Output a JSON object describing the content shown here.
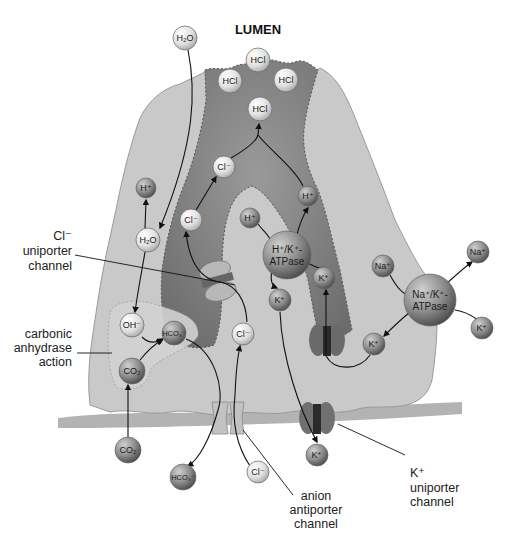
{
  "title": "LUMEN",
  "labels": {
    "cl_uniporter": [
      "Cl⁻",
      "uniporter",
      "channel"
    ],
    "carbonic": [
      "carbonic",
      "anhydrase",
      "action"
    ],
    "anion_antiporter": [
      "anion",
      "antiporter",
      "channel"
    ],
    "k_uniporter": [
      "K⁺",
      "uniporter",
      "channel"
    ]
  },
  "molecules": [
    {
      "id": "h2o-lumen",
      "text": "H₂O",
      "x": 185,
      "y": 38,
      "r": 12,
      "shade": "light"
    },
    {
      "id": "hcl-top",
      "text": "HCl",
      "x": 258,
      "y": 60,
      "r": 12,
      "shade": "light"
    },
    {
      "id": "hcl-left",
      "text": "HCl",
      "x": 230,
      "y": 81,
      "r": 12,
      "shade": "light"
    },
    {
      "id": "hcl-right",
      "text": "HCl",
      "x": 286,
      "y": 80,
      "r": 12,
      "shade": "light"
    },
    {
      "id": "hcl-center",
      "text": "HCl",
      "x": 260,
      "y": 109,
      "r": 12,
      "shade": "light"
    },
    {
      "id": "cl-upper",
      "text": "Cl⁻",
      "x": 224,
      "y": 167,
      "r": 11,
      "shade": "light"
    },
    {
      "id": "cl-mid",
      "text": "Cl⁻",
      "x": 191,
      "y": 220,
      "r": 11,
      "shade": "light"
    },
    {
      "id": "h-left",
      "text": "H⁺",
      "x": 146,
      "y": 188,
      "r": 10,
      "shade": "dark"
    },
    {
      "id": "h2o-cell",
      "text": "H₂O",
      "x": 148,
      "y": 240,
      "r": 12,
      "shade": "light"
    },
    {
      "id": "h-right-upper",
      "text": "H⁺",
      "x": 308,
      "y": 196,
      "r": 10,
      "shade": "dark"
    },
    {
      "id": "h-right-lower",
      "text": "H⁺",
      "x": 250,
      "y": 218,
      "r": 10,
      "shade": "dark"
    },
    {
      "id": "hk-atpase",
      "text": "H⁺/K⁺-|ATPase",
      "x": 287,
      "y": 255,
      "r": 24,
      "shade": "dark"
    },
    {
      "id": "k-channel-top",
      "text": "K⁺",
      "x": 324,
      "y": 278,
      "r": 11,
      "shade": "dark"
    },
    {
      "id": "k-left",
      "text": "K⁺",
      "x": 280,
      "y": 300,
      "r": 11,
      "shade": "dark"
    },
    {
      "id": "oh",
      "text": "OH⁻",
      "x": 132,
      "y": 325,
      "r": 12,
      "shade": "light"
    },
    {
      "id": "hco3-cell",
      "text": "HCO₃⁻",
      "x": 174,
      "y": 333,
      "r": 12,
      "shade": "dark"
    },
    {
      "id": "cl-cell",
      "text": "Cl⁻",
      "x": 243,
      "y": 334,
      "r": 11,
      "shade": "light"
    },
    {
      "id": "co2-cell",
      "text": "CO₂",
      "x": 132,
      "y": 371,
      "r": 13,
      "shade": "dark"
    },
    {
      "id": "na-in",
      "text": "Na⁺",
      "x": 383,
      "y": 266,
      "r": 11,
      "shade": "dark"
    },
    {
      "id": "na-out",
      "text": "Na⁺",
      "x": 478,
      "y": 252,
      "r": 11,
      "shade": "dark"
    },
    {
      "id": "nak-atpase",
      "text": "Na⁺/K⁺-|ATPase",
      "x": 430,
      "y": 300,
      "r": 26,
      "shade": "dark"
    },
    {
      "id": "k-right-out",
      "text": "K⁺",
      "x": 482,
      "y": 328,
      "r": 11,
      "shade": "dark"
    },
    {
      "id": "k-right-in",
      "text": "K⁺",
      "x": 374,
      "y": 344,
      "r": 11,
      "shade": "dark"
    },
    {
      "id": "co2-blood",
      "text": "CO₂",
      "x": 128,
      "y": 450,
      "r": 13,
      "shade": "dark"
    },
    {
      "id": "hco3-blood",
      "text": "HCO₃⁻",
      "x": 183,
      "y": 477,
      "r": 13,
      "shade": "dark"
    },
    {
      "id": "cl-blood",
      "text": "Cl⁻",
      "x": 258,
      "y": 472,
      "r": 11,
      "shade": "light"
    },
    {
      "id": "k-blood",
      "text": "K⁺",
      "x": 317,
      "y": 455,
      "r": 11,
      "shade": "dark"
    }
  ],
  "colors": {
    "cell_fill": "#c9c9c9",
    "cell_edge": "#9a9a9a",
    "canaliculus": "#8a8a8a",
    "canaliculus_dark": "#6e6e6e",
    "membrane": "#9e9e9e",
    "mol_light": "#e4e4e4",
    "mol_dark": "#8c8c8c",
    "channel_light": "#bdbdbd",
    "channel_dark": "#6a6a6a"
  }
}
